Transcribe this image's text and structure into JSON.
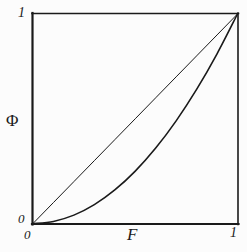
{
  "figure": {
    "background_color": "#fcfcfc",
    "ink_color": "#1a1a1a"
  },
  "labels": {
    "y_axis": "Φ",
    "x_axis": "F",
    "y_tick_max": "1",
    "y_tick_min": "0",
    "x_tick_min": "0",
    "x_tick_max": "1"
  },
  "chart_data": {
    "type": "line",
    "title": "",
    "xlabel": "F",
    "ylabel": "Φ",
    "xlim": [
      0,
      1
    ],
    "ylim": [
      0,
      1
    ],
    "xticks": [
      0,
      1
    ],
    "yticks": [
      0,
      1
    ],
    "xticklabels": [
      "0",
      "1"
    ],
    "yticklabels": [
      "0",
      "1"
    ],
    "grid": false,
    "legend": false,
    "frame": "box",
    "series": [
      {
        "name": "diagonal",
        "description": "straight line Φ = F from (0,0) to (1,1)",
        "x": [
          0,
          0.1,
          0.2,
          0.3,
          0.4,
          0.5,
          0.6,
          0.7,
          0.8,
          0.9,
          1
        ],
        "values": [
          0,
          0.1,
          0.2,
          0.3,
          0.4,
          0.5,
          0.6,
          0.7,
          0.8,
          0.9,
          1
        ],
        "color": "#1a1a1a",
        "linewidth": 1
      },
      {
        "name": "quadratic-curve",
        "description": "convex curve Φ = F^2 from (0,0) to (1,1)",
        "x": [
          0,
          0.1,
          0.2,
          0.3,
          0.4,
          0.5,
          0.6,
          0.7,
          0.8,
          0.9,
          1
        ],
        "values": [
          0,
          0.01,
          0.04,
          0.09,
          0.16,
          0.25,
          0.36,
          0.49,
          0.64,
          0.81,
          1
        ],
        "color": "#1a1a1a",
        "linewidth": 1.6
      }
    ]
  }
}
